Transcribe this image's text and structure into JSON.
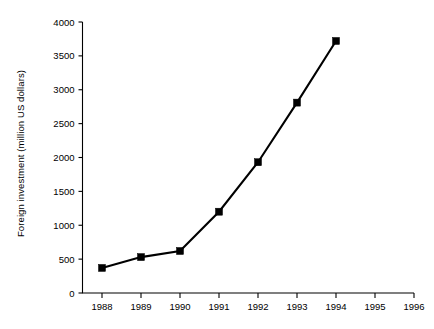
{
  "chart_data": {
    "type": "line",
    "title": "",
    "xlabel": "",
    "ylabel": "Foreign investment (million US dollars)",
    "x": [
      1988,
      1989,
      1990,
      1991,
      1992,
      1993,
      1994
    ],
    "values": [
      370,
      530,
      620,
      1200,
      1930,
      2810,
      3720
    ],
    "series": [
      {
        "name": "Foreign investment",
        "x": [
          1988,
          1989,
          1990,
          1991,
          1992,
          1993,
          1994
        ],
        "values": [
          370,
          530,
          620,
          1200,
          1930,
          2810,
          3720
        ],
        "color": "#000000",
        "marker": "filled-square"
      }
    ],
    "xlim": [
      1987.5,
      1996.0
    ],
    "ylim": [
      0,
      4000
    ],
    "xticks": [
      1988,
      1989,
      1990,
      1991,
      1992,
      1993,
      1994,
      1995,
      1996
    ],
    "xtick_labels": [
      "1988",
      "1989",
      "1990",
      "1991",
      "1992",
      "1993",
      "1994",
      "1995",
      "1996"
    ],
    "yticks": [
      0,
      500,
      1000,
      1500,
      2000,
      2500,
      3000,
      3500,
      4000
    ],
    "ytick_labels": [
      "0",
      "500",
      "1000",
      "1500",
      "2000",
      "2500",
      "3000",
      "3500",
      "4000"
    ],
    "grid": false,
    "legend": false,
    "legend_position": "none",
    "axis_color": "#000000",
    "background_color": "#ffffff"
  }
}
